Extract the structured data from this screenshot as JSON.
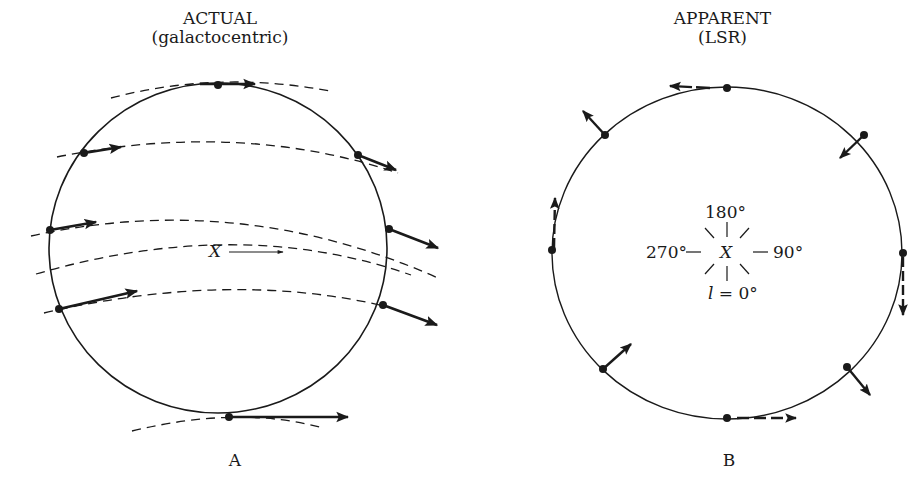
{
  "panels": [
    {
      "id": "A",
      "title": "ACTUAL",
      "subtitle": "(galactocentric)",
      "caption": "A",
      "center_label": "X",
      "description": "Circle of stars around X; each star moves along a dashed galactic rotation path with rightward velocity arrows"
    },
    {
      "id": "B",
      "title": "APPARENT",
      "subtitle": "(LSR)",
      "caption": "B",
      "center_label": "X",
      "longitude_labels": {
        "top": "180°",
        "right": "90°",
        "left": "270°",
        "bottom_var": "l",
        "bottom_eq": "=",
        "bottom": "0°"
      },
      "description": "Same circle of stars as seen relative to the Local Standard of Rest; apparent velocity arrows show differential rotation pattern"
    }
  ],
  "colors": {
    "ink": "#1a1a1a",
    "background": "#ffffff"
  }
}
